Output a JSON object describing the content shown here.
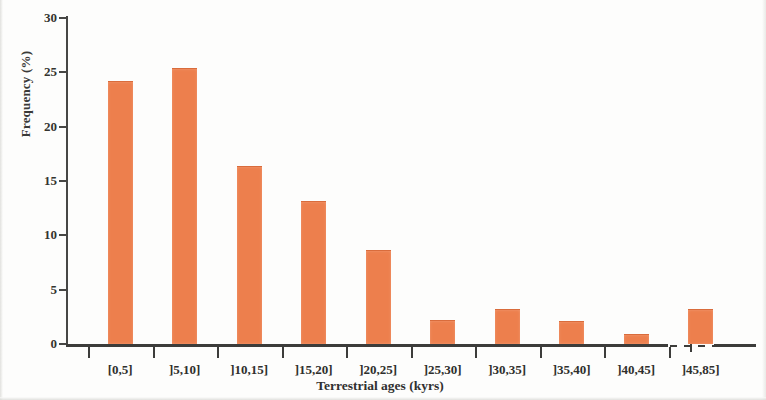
{
  "chart_data": {
    "type": "bar",
    "title": "",
    "xlabel": "Terrestrial ages (kyrs)",
    "ylabel": "Frequency (%)",
    "categories": [
      "[0,5]",
      "]5,10]",
      "]10,15]",
      "]15,20]",
      "]20,25]",
      "]25,30]",
      "]30,35]",
      "]35,40]",
      "]40,45]",
      "]45,85]"
    ],
    "values": [
      24.1,
      25.3,
      16.3,
      13.1,
      8.6,
      2.1,
      3.1,
      2.0,
      0.8,
      3.1
    ],
    "ylim": [
      0,
      30
    ],
    "yticks": [
      0,
      5,
      10,
      15,
      20,
      25,
      30
    ],
    "ytick_labels": [
      "0",
      "5",
      "10",
      "15",
      "20",
      "25",
      "30"
    ],
    "grid": false,
    "legend": false,
    "bar_color": "#ed7f4d",
    "axis_color": "#3c3c3a",
    "axis_break": {
      "present": true,
      "between": [
        "]40,45]",
        "]45,85]"
      ],
      "style": "dashed"
    }
  }
}
